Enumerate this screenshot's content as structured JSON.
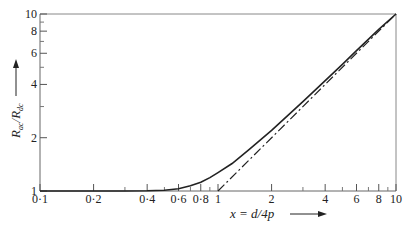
{
  "chart_data": {
    "type": "line",
    "title": "",
    "xlabel": "x = d/4p",
    "ylabel": "R_ac / R_dc",
    "xscale": "log",
    "yscale": "log",
    "xlim": [
      0.1,
      10
    ],
    "ylim": [
      1,
      10
    ],
    "grid": false,
    "x_ticks_labeled": [
      "0·1",
      "0·2",
      "0·4",
      "0·6",
      "0·8",
      "1",
      "2",
      "4",
      "6",
      "8",
      "10"
    ],
    "x_tick_values": [
      0.1,
      0.2,
      0.4,
      0.6,
      0.8,
      1,
      2,
      4,
      6,
      8,
      10
    ],
    "x_minor_ticks": [
      0.3,
      0.5,
      0.7,
      0.9,
      3,
      5,
      7,
      9
    ],
    "y_ticks_labeled": [
      "1",
      "2",
      "4",
      "6",
      "8",
      "10"
    ],
    "y_tick_values": [
      1,
      2,
      4,
      6,
      8,
      10
    ],
    "y_minor_ticks": [
      3,
      5,
      7,
      9
    ],
    "series": [
      {
        "name": "R_ac/R_dc",
        "style": "solid",
        "x": [
          0.1,
          0.2,
          0.3,
          0.4,
          0.5,
          0.6,
          0.7,
          0.8,
          0.9,
          1.0,
          1.2,
          1.5,
          2,
          3,
          4,
          5,
          6,
          8,
          10
        ],
        "y": [
          1.0,
          1.0,
          1.0,
          1.003,
          1.01,
          1.03,
          1.07,
          1.12,
          1.19,
          1.27,
          1.43,
          1.72,
          2.2,
          3.2,
          4.2,
          5.2,
          6.2,
          8.2,
          10.0
        ]
      },
      {
        "name": "asymptote R_ac/R_dc = x",
        "style": "dash-dot",
        "x": [
          1,
          10
        ],
        "y": [
          1,
          10
        ]
      }
    ]
  },
  "axes": {
    "xlabel_text": "x = d/4p",
    "ylabel_main": "R",
    "ylabel_sub1": "ac",
    "ylabel_slash": "/",
    "ylabel_sub2": "dc"
  }
}
